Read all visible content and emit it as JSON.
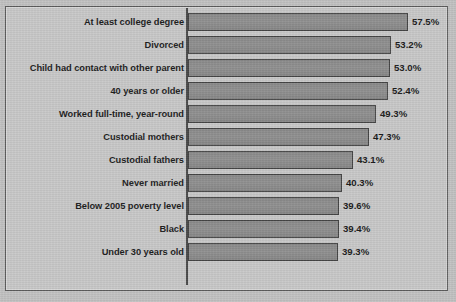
{
  "colors": {
    "background": "#c2c2c2",
    "plot_background": "#c9c9c9",
    "frame_border": "#5d5d5d",
    "bar_fill": "#8d8d8d",
    "bar_border": "#454545",
    "axis": "#4a4a4a",
    "label_text": "#1d1d1d"
  },
  "chart_data": {
    "type": "bar",
    "orientation": "horizontal",
    "title": "",
    "subtitle": "",
    "xlabel": "",
    "ylabel": "",
    "grid": false,
    "legend": false,
    "xlim": [
      0,
      60
    ],
    "value_suffix": "%",
    "categories": [
      "At least college degree",
      "Divorced",
      "Child had contact with other parent",
      "40 years or older",
      "Worked full-time, year-round",
      "Custodial mothers",
      "Custodial fathers",
      "Never married",
      "Below 2005 poverty level",
      "Black",
      "Under 30 years old"
    ],
    "values": [
      57.5,
      53.2,
      53.0,
      52.4,
      49.3,
      47.3,
      43.1,
      40.3,
      39.6,
      39.4,
      39.3
    ],
    "value_labels": [
      "57.5%",
      "53.2%",
      "53.0%",
      "52.4%",
      "49.3%",
      "47.3%",
      "43.1%",
      "40.3%",
      "39.6%",
      "39.4%",
      "39.3%"
    ]
  }
}
